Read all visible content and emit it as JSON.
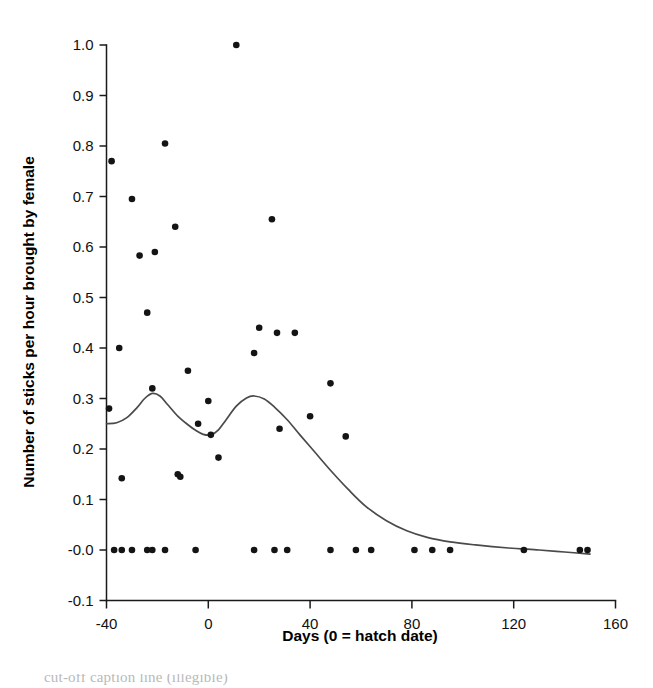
{
  "figure": {
    "background_color": "#ffffff",
    "point_color": "#141414",
    "line_color": "#4a4a4a",
    "axis_color": "#1a1a1a",
    "caption_partial": "cut-off caption line (illegible)"
  },
  "chart_data": {
    "type": "scatter",
    "title": "",
    "xlabel": "Days (0 = hatch date)",
    "ylabel": "Number of sticks per hour brought by female",
    "xlim": [
      -40,
      160
    ],
    "ylim": [
      -0.1,
      1.0
    ],
    "xticks": [
      -40,
      0,
      40,
      80,
      120,
      160
    ],
    "xticklabels": [
      "-40",
      "0",
      "40",
      "80",
      "120",
      "160"
    ],
    "yticks": [
      -0.1,
      0.0,
      0.1,
      0.2,
      0.3,
      0.4,
      0.5,
      0.6,
      0.7,
      0.8,
      0.9,
      1.0
    ],
    "yticklabels": [
      "-0.1",
      "-0.0",
      "0.1",
      "0.2",
      "0.3",
      "0.4",
      "0.5",
      "0.6",
      "0.7",
      "0.8",
      "0.9",
      "1.0"
    ],
    "grid": false,
    "legend": null,
    "series": [
      {
        "name": "observations",
        "marker": "filled-circle",
        "points": [
          [
            -38,
            0.77
          ],
          [
            -39,
            0.28
          ],
          [
            -35,
            0.4
          ],
          [
            -34,
            0.142
          ],
          [
            -30,
            0.695
          ],
          [
            -27,
            0.583
          ],
          [
            -24,
            0.47
          ],
          [
            -22,
            0.32
          ],
          [
            -21,
            0.59
          ],
          [
            -17,
            0.805
          ],
          [
            -13,
            0.64
          ],
          [
            -12,
            0.15
          ],
          [
            -11,
            0.145
          ],
          [
            -8,
            0.355
          ],
          [
            -4,
            0.25
          ],
          [
            0,
            0.295
          ],
          [
            1,
            0.228
          ],
          [
            4,
            0.183
          ],
          [
            11,
            1.0
          ],
          [
            18,
            0.39
          ],
          [
            20,
            0.44
          ],
          [
            25,
            0.655
          ],
          [
            27,
            0.43
          ],
          [
            28,
            0.24
          ],
          [
            34,
            0.43
          ],
          [
            40,
            0.265
          ],
          [
            48,
            0.33
          ],
          [
            54,
            0.225
          ],
          [
            -37,
            0.0
          ],
          [
            -34,
            0.0
          ],
          [
            -30,
            0.0
          ],
          [
            -24,
            0.0
          ],
          [
            -22,
            0.0
          ],
          [
            -17,
            0.0
          ],
          [
            -5,
            0.0
          ],
          [
            18,
            0.0
          ],
          [
            26,
            0.0
          ],
          [
            31,
            0.0
          ],
          [
            48,
            0.0
          ],
          [
            58,
            0.0
          ],
          [
            64,
            0.0
          ],
          [
            81,
            0.0
          ],
          [
            88,
            0.0
          ],
          [
            95,
            0.0
          ],
          [
            124,
            0.0
          ],
          [
            146,
            0.0
          ],
          [
            149,
            0.0
          ]
        ]
      },
      {
        "name": "smoother",
        "marker": "line",
        "points": [
          [
            -40,
            0.25
          ],
          [
            -36,
            0.252
          ],
          [
            -32,
            0.262
          ],
          [
            -28,
            0.282
          ],
          [
            -25,
            0.3
          ],
          [
            -22,
            0.31
          ],
          [
            -19,
            0.305
          ],
          [
            -16,
            0.288
          ],
          [
            -12,
            0.265
          ],
          [
            -8,
            0.248
          ],
          [
            -5,
            0.237
          ],
          [
            -2,
            0.229
          ],
          [
            1,
            0.228
          ],
          [
            4,
            0.238
          ],
          [
            7,
            0.258
          ],
          [
            11,
            0.285
          ],
          [
            15,
            0.301
          ],
          [
            18,
            0.305
          ],
          [
            22,
            0.299
          ],
          [
            26,
            0.283
          ],
          [
            31,
            0.258
          ],
          [
            36,
            0.228
          ],
          [
            42,
            0.193
          ],
          [
            48,
            0.158
          ],
          [
            55,
            0.12
          ],
          [
            62,
            0.086
          ],
          [
            70,
            0.058
          ],
          [
            78,
            0.038
          ],
          [
            86,
            0.025
          ],
          [
            95,
            0.016
          ],
          [
            105,
            0.01
          ],
          [
            118,
            0.004
          ],
          [
            130,
            0.0
          ],
          [
            140,
            -0.004
          ],
          [
            150,
            -0.008
          ]
        ]
      }
    ]
  }
}
